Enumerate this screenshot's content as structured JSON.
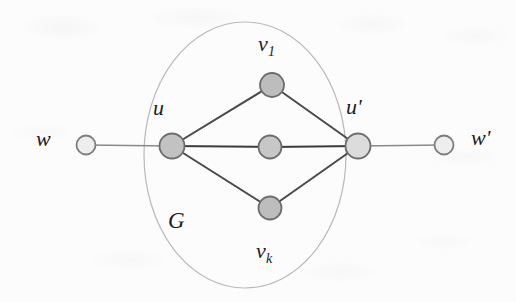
{
  "figure": {
    "background_color": "#fcfcfc",
    "ink_color": "#3a3a3a",
    "labels": {
      "w": "w",
      "w_prime_base": "w",
      "w_prime_mark": "'",
      "u": "u",
      "u_prime_base": "u",
      "u_prime_mark": "'",
      "v_base": "v",
      "v_first_sub": "1",
      "v_last_sub": "k",
      "G": "G"
    },
    "region": {
      "name": "G",
      "shape": "ellipse",
      "cx": 245,
      "cy": 155,
      "rx": 101,
      "ry": 133,
      "stroke": "#b9b9b9",
      "stroke_width": 1.2
    },
    "nodes": [
      {
        "id": "w",
        "label": "w",
        "cx": 86,
        "cy": 145,
        "r": 9.5,
        "fill": "#eeeeee",
        "stroke": "#7d7d7d",
        "inside_G": false
      },
      {
        "id": "u",
        "label": "u",
        "cx": 172,
        "cy": 146,
        "r": 12.5,
        "fill": "#c2c2c2",
        "stroke": "#6d6d6d",
        "inside_G": true
      },
      {
        "id": "v1",
        "label": "v1",
        "cx": 272,
        "cy": 85,
        "r": 12.0,
        "fill": "#bdbdbd",
        "stroke": "#6d6d6d",
        "inside_G": true
      },
      {
        "id": "vmid",
        "label": "",
        "cx": 270,
        "cy": 147,
        "r": 11.5,
        "fill": "#c7c7c7",
        "stroke": "#6d6d6d",
        "inside_G": true
      },
      {
        "id": "vk",
        "label": "vk",
        "cx": 270,
        "cy": 208,
        "r": 11.5,
        "fill": "#bdbdbd",
        "stroke": "#6d6d6d",
        "inside_G": true
      },
      {
        "id": "uprime",
        "label": "u'",
        "cx": 358,
        "cy": 146,
        "r": 12.5,
        "fill": "#dcdcdc",
        "stroke": "#6d6d6d",
        "inside_G": true
      },
      {
        "id": "wprime",
        "label": "w'",
        "cx": 444,
        "cy": 145,
        "r": 9.5,
        "fill": "#eeeeee",
        "stroke": "#7d7d7d",
        "inside_G": false
      }
    ],
    "edges": [
      {
        "from": "w",
        "to": "u",
        "stroke": "#8a8a8a",
        "stroke_width": 1.5
      },
      {
        "from": "u",
        "to": "v1",
        "stroke": "#4a4a4a",
        "stroke_width": 2.0
      },
      {
        "from": "u",
        "to": "vmid",
        "stroke": "#3c3c3c",
        "stroke_width": 2.0
      },
      {
        "from": "u",
        "to": "vk",
        "stroke": "#4a4a4a",
        "stroke_width": 2.0
      },
      {
        "from": "v1",
        "to": "uprime",
        "stroke": "#4a4a4a",
        "stroke_width": 2.0
      },
      {
        "from": "vmid",
        "to": "uprime",
        "stroke": "#3c3c3c",
        "stroke_width": 2.0
      },
      {
        "from": "vk",
        "to": "uprime",
        "stroke": "#4a4a4a",
        "stroke_width": 2.0
      },
      {
        "from": "uprime",
        "to": "wprime",
        "stroke": "#8a8a8a",
        "stroke_width": 1.5
      }
    ]
  }
}
